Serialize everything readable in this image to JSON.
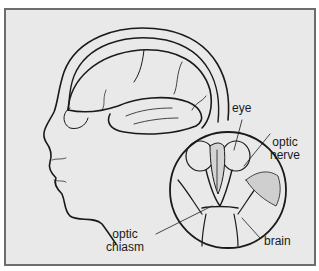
{
  "figure": {
    "frame_color": "#6d6d6d",
    "background_color": "#e9e9e9",
    "line_color": "#1a1a1a"
  },
  "labels": {
    "eye": "eye",
    "optic_nerve_line1": "optic",
    "optic_nerve_line2": "nerve",
    "optic_chiasm_line1": "optic",
    "optic_chiasm_line2": "chiasm",
    "brain": "brain"
  }
}
